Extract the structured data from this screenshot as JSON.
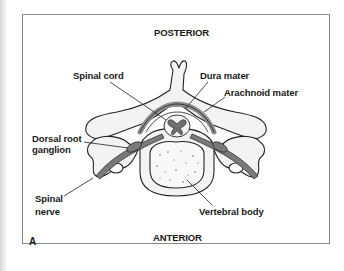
{
  "figure": {
    "panel_letter": "A",
    "orientation": {
      "top": "POSTERIOR",
      "bottom": "ANTERIOR"
    },
    "labels": {
      "spinal_cord": "Spinal cord",
      "dura_mater": "Dura mater",
      "arachnoid_mater": "Arachnoid mater",
      "dorsal_root_ganglion_line1": "Dorsal root",
      "dorsal_root_ganglion_line2": "ganglion",
      "spinal_nerve_line1": "Spinal",
      "spinal_nerve_line2": "nerve",
      "vertebral_body": "Vertebral body"
    },
    "colors": {
      "bone_fill": "#f3f3f3",
      "outline": "#222222",
      "meninges": "#8c8c8c",
      "nerve": "#7a7a7a",
      "grey_matter": "#6e6e6e",
      "frame_border": "#8a8a8a"
    }
  }
}
